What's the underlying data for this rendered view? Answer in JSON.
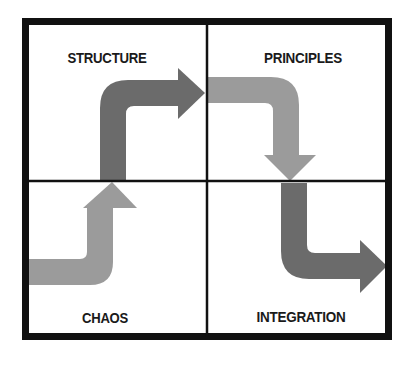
{
  "diagram": {
    "type": "quadrant-progression",
    "quadrants": [
      {
        "id": "structure",
        "label": "STRUCTURE",
        "position": "top-left"
      },
      {
        "id": "principles",
        "label": "PRINCIPLES",
        "position": "top-right"
      },
      {
        "id": "chaos",
        "label": "CHAOS",
        "position": "bottom-left"
      },
      {
        "id": "integration",
        "label": "INTEGRATION",
        "position": "bottom-right"
      }
    ],
    "flow": [
      "CHAOS",
      "STRUCTURE",
      "PRINCIPLES",
      "INTEGRATION"
    ],
    "arrows": [
      {
        "from": "chaos",
        "to": "structure",
        "shade": "light"
      },
      {
        "from": "structure",
        "to": "principles",
        "shade": "dark"
      },
      {
        "from": "principles",
        "to": "integration",
        "shade": "light"
      },
      {
        "from": "integration",
        "to": "exit",
        "shade": "dark"
      }
    ],
    "colors": {
      "frame": "#111111",
      "arrow_dark": "#6b6b6b",
      "arrow_light": "#9b9b9b",
      "label": "#1a1a1a",
      "background": "#ffffff"
    }
  }
}
